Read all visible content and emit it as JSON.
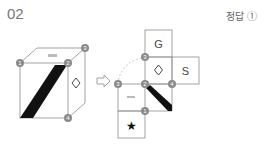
{
  "problem": {
    "number": "02",
    "answer_label": "정답",
    "answer_value": "①"
  },
  "cube": {
    "markers": [
      "1",
      "2",
      "3",
      "4"
    ],
    "front_face": "diagonal-black-stripe",
    "right_face_symbol": "◇",
    "top_face_symbol": "small-glyph"
  },
  "net": {
    "faces": {
      "top": "G",
      "center": "◇",
      "right": "S",
      "left_small": "small-glyph",
      "stripe": "diagonal-black-stripe",
      "bottom": "★"
    },
    "markers": [
      "3",
      "3",
      "2",
      "4",
      "1"
    ]
  },
  "colors": {
    "line": "#999999",
    "marker": "#8a8a8a",
    "stripe": "#111111",
    "text": "#555555"
  }
}
